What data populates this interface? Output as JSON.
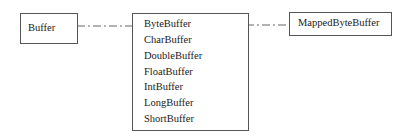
{
  "diagram": {
    "left_box": {
      "label": "Buffer"
    },
    "middle_box": {
      "items": [
        "ByteBuffer",
        "CharBuffer",
        "DoubleBuffer",
        "FloatBuffer",
        "IntBuffer",
        "LongBuffer",
        "ShortBuffer"
      ]
    },
    "right_box": {
      "label": "MappedByteBuffer"
    },
    "connectors": [
      {
        "from": "Buffer",
        "to": "ByteBuffer",
        "style": "dash-dot"
      },
      {
        "from": "ByteBuffer",
        "to": "MappedByteBuffer",
        "style": "dash-dot"
      }
    ],
    "colors": {
      "line": "#555555",
      "text": "#1a1a1a",
      "background": "#ffffff"
    }
  }
}
